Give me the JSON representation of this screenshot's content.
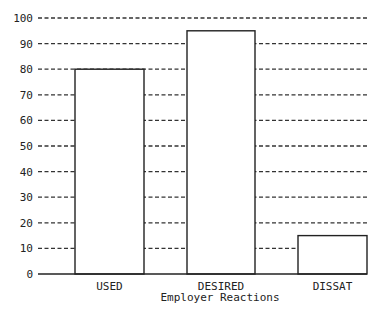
{
  "chart_data": {
    "type": "bar",
    "title": "",
    "xlabel": "Employer Reactions",
    "ylabel": "",
    "categories": [
      "USED",
      "DESIRED",
      "DISSAT"
    ],
    "values": [
      80,
      95,
      15
    ],
    "ylim": [
      0,
      100
    ],
    "yticks": [
      0,
      10,
      20,
      30,
      40,
      50,
      60,
      70,
      80,
      90,
      100
    ],
    "grid": "dashed horizontal",
    "legend": null
  },
  "colors": {
    "bar_fill": "#ffffff",
    "bar_stroke": "#222222",
    "grid": "#333333",
    "text": "#222222"
  }
}
